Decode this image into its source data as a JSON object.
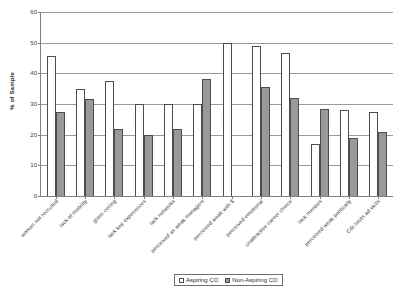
{
  "chart_data": {
    "type": "bar",
    "title": "",
    "xlabel": "",
    "ylabel": "% of Sample",
    "ylim": [
      0,
      60
    ],
    "ytick_step": 10,
    "yticks": [
      0,
      10,
      20,
      30,
      40,
      50,
      60
    ],
    "grid": true,
    "legend_position": "bottom",
    "categories": [
      "women not recruited",
      "lack of mobility",
      "glass ceiling",
      "lack key experiences",
      "lack networks",
      "perceived as weak managers",
      "perceived weak with $",
      "perceived emotional",
      "unattractive career choice",
      "lack mentors",
      "perceived weak politically",
      "C&I limits ad skills"
    ],
    "series": [
      {
        "name": "Aspiring CO",
        "color": "#ffffff",
        "values": [
          45.5,
          35.0,
          37.5,
          30.0,
          30.0,
          30.0,
          50.0,
          49.0,
          46.5,
          17.0,
          28.0,
          27.5
        ]
      },
      {
        "name": "Non-Aspiring CO",
        "color": "#999999",
        "values": [
          27.5,
          31.5,
          22.0,
          20.0,
          22.0,
          38.0,
          0.0,
          35.5,
          32.0,
          28.5,
          19.0,
          21.0
        ]
      }
    ]
  },
  "axis": {
    "y_title": "% of Sample"
  },
  "legend": {
    "entries": [
      {
        "label": "Aspiring CO"
      },
      {
        "label": "Non-Aspiring CO"
      }
    ]
  }
}
